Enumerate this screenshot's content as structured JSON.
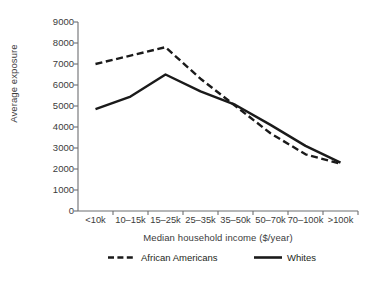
{
  "chart_data": {
    "type": "line",
    "title": "",
    "xlabel": "Median household income ($/year)",
    "ylabel": "Average exposure",
    "categories": [
      "<10k",
      "10–15k",
      "15–25k",
      "25–35k",
      "35–50k",
      "50–70k",
      "70–100k",
      ">100k"
    ],
    "ylim": [
      0,
      9000
    ],
    "yticks": [
      0,
      1000,
      2000,
      3000,
      4000,
      5000,
      6000,
      7000,
      8000,
      9000
    ],
    "ytick_labels": [
      "0",
      "1000",
      "2000",
      "3000",
      "4000",
      "5000",
      "6000",
      "7000",
      "8000",
      "9000"
    ],
    "grid": false,
    "legend_position": "bottom",
    "series": [
      {
        "name": "African Americans",
        "style": "dashed",
        "color": "#1a1a1a",
        "values": [
          7000,
          7400,
          7800,
          6300,
          5000,
          3700,
          2700,
          2250
        ]
      },
      {
        "name": "Whites",
        "style": "solid",
        "color": "#1a1a1a",
        "values": [
          4850,
          5450,
          6500,
          5700,
          5050,
          4100,
          3100,
          2300
        ]
      }
    ]
  },
  "axis": {
    "ylabel": "Average exposure",
    "xlabel": "Median household income ($/year)"
  },
  "legend": {
    "items": [
      {
        "label": "African Americans",
        "style": "dashed"
      },
      {
        "label": "Whites",
        "style": "solid"
      }
    ]
  }
}
